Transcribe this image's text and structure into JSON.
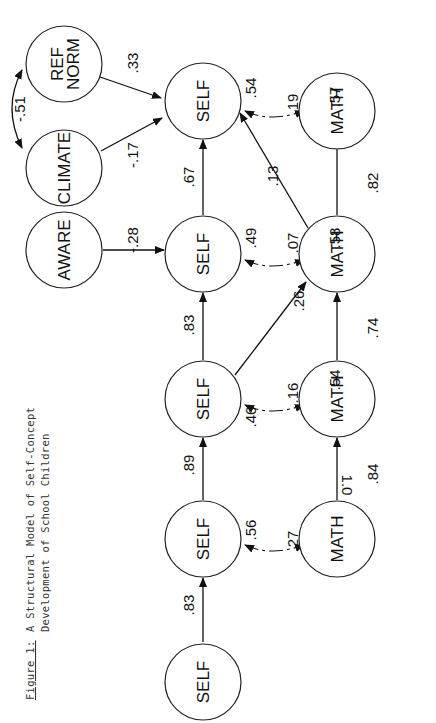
{
  "caption": {
    "figure_label": "Figure 1:",
    "line1": "A Structural Model of Self-Concept",
    "line2": "Development of School Children"
  },
  "nodes": {
    "self_1": "SELF",
    "self_2": "SELF",
    "self_3": "SELF",
    "self_4": "SELF",
    "self_5": "SELF",
    "math_2": "MATH",
    "math_3": "MATH",
    "math_4": "MATH",
    "math_5": "MATH",
    "aware": "AWARE",
    "climate": "CLIMATE",
    "ref_norm_1": "REF",
    "ref_norm_2": "NORM"
  },
  "paths": {
    "self1_self2": ".83",
    "self2_self3": ".89",
    "self3_self4": ".83",
    "self4_self5": ".67",
    "math2_math3": ".84",
    "math3_math4": ".74",
    "math4_math5": ".82",
    "self3_math4": ".26",
    "math4_self5": ".13",
    "aware_self4": "-.28",
    "climate_self5": "-.17",
    "refnorm_self5": ".33",
    "climate_refnorm_corr": "-.51"
  },
  "correlations": {
    "t2": {
      "self_resid": ".56",
      "corr": ".27",
      "math_resid": "1.0"
    },
    "t3": {
      "self_resid": ".46",
      "corr": ".16",
      "math_resid": ".54"
    },
    "t4": {
      "self_resid": ".49",
      "corr": ".07",
      "math_resid": ".58"
    },
    "t5": {
      "self_resid": ".54",
      "corr": ".19",
      "math_resid": ".57"
    }
  }
}
